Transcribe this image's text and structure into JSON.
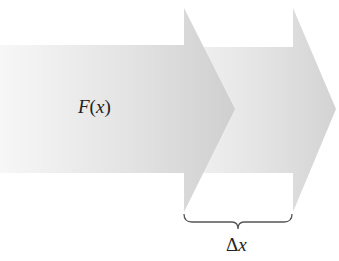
{
  "diagram": {
    "type": "shifted-arrows",
    "arrows": [
      {
        "name": "arrow-at-x",
        "label": "F(x)",
        "body": {
          "x0": 0,
          "x1": 184,
          "y0": 45,
          "y1": 173
        },
        "head": {
          "base_x": 184,
          "tip_x": 235,
          "top_y": 8,
          "bottom_y": 212,
          "tip_y": 109
        }
      },
      {
        "name": "arrow-at-x-plus-dx",
        "body": {
          "x0": 184,
          "x1": 293,
          "y0": 47,
          "y1": 173
        },
        "head": {
          "base_x": 293,
          "tip_x": 336,
          "top_y": 8,
          "bottom_y": 212,
          "tip_y": 109
        }
      }
    ],
    "brace": {
      "x0": 184,
      "x1": 292,
      "y": 222,
      "label": "Δx"
    }
  },
  "labels": {
    "fx_func": "F",
    "fx_open": "(",
    "fx_var": "x",
    "fx_close": ")",
    "dx_delta": "Δ",
    "dx_var": "x"
  },
  "colors": {
    "arrow_light": "#f4f4f4",
    "arrow_mid": "#dcdcdc",
    "arrow_dark": "#c8c8c8",
    "brace": "#555555",
    "text": "#222222"
  }
}
